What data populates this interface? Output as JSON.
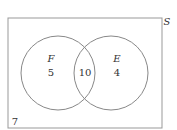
{
  "diagram": {
    "type": "venn",
    "universe_label": "S",
    "sets": [
      {
        "label": "F",
        "only_count": "5"
      },
      {
        "label": "E",
        "only_count": "4"
      }
    ],
    "intersection_count": "10",
    "outside_count": "7",
    "colors": {
      "stroke": "#888888",
      "text": "#333333",
      "background": "#ffffff"
    }
  }
}
